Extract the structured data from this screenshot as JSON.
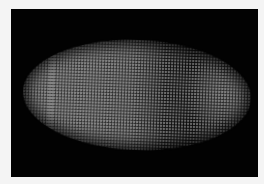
{
  "image": {
    "subject": "fluorescent-embryo-micrograph",
    "colors": {
      "background": "#020202",
      "border": "#f4f4f4",
      "signal": "#5f5f5f"
    }
  }
}
